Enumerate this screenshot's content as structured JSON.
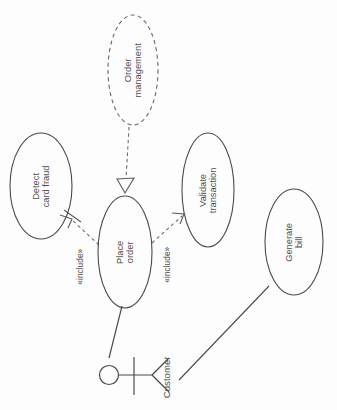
{
  "diagram": {
    "type": "uml-use-case",
    "orientation": "rotated-90-ccw",
    "background_color": "#fdfdfd",
    "stroke_color": "#4a4a4a",
    "use_cases": [
      {
        "id": "order-management",
        "label": "Order\nmanagement",
        "line1": "Order",
        "line2": "management",
        "border": "dashed",
        "cx": 133,
        "cy": 70,
        "rx": 25,
        "ry": 55
      },
      {
        "id": "detect-card-fraud",
        "label": "Detect\ncard fraud",
        "line1": "Detect",
        "line2": "card fraud",
        "border": "solid",
        "cx": 41,
        "cy": 186,
        "rx": 31,
        "ry": 53
      },
      {
        "id": "place-order",
        "label": "Place\norder",
        "line1": "Place",
        "line2": "order",
        "border": "solid",
        "cx": 125,
        "cy": 252,
        "rx": 27,
        "ry": 56
      },
      {
        "id": "validate-transaction",
        "label": "Validate\ntransaction",
        "line1": "Validate",
        "line2": "transaction",
        "border": "solid",
        "cx": 208,
        "cy": 190,
        "rx": 26,
        "ry": 57
      },
      {
        "id": "generate-bill",
        "label": "Generate\nbill",
        "line1": "Generate",
        "line2": "bill",
        "border": "solid",
        "cx": 294,
        "cy": 242,
        "rx": 29,
        "ry": 53
      }
    ],
    "actor": {
      "id": "customer",
      "label": "Customer"
    },
    "relationships": [
      {
        "id": "include-detect-card-fraud",
        "from": "place-order",
        "to": "detect-card-fraud",
        "stereotype": "«include»",
        "style": "dashed-open-arrow"
      },
      {
        "id": "include-validate-transaction",
        "from": "place-order",
        "to": "validate-transaction",
        "stereotype": "«include»",
        "style": "dashed-open-arrow"
      },
      {
        "id": "generalization-order-management",
        "from": "order-management",
        "to": "place-order",
        "stereotype": "",
        "style": "dashed-hollow-triangle"
      },
      {
        "id": "assoc-customer-place-order",
        "from": "customer",
        "to": "place-order",
        "stereotype": "",
        "style": "solid"
      },
      {
        "id": "assoc-customer-generate-bill",
        "from": "customer",
        "to": "generate-bill",
        "stereotype": "",
        "style": "solid"
      }
    ]
  }
}
